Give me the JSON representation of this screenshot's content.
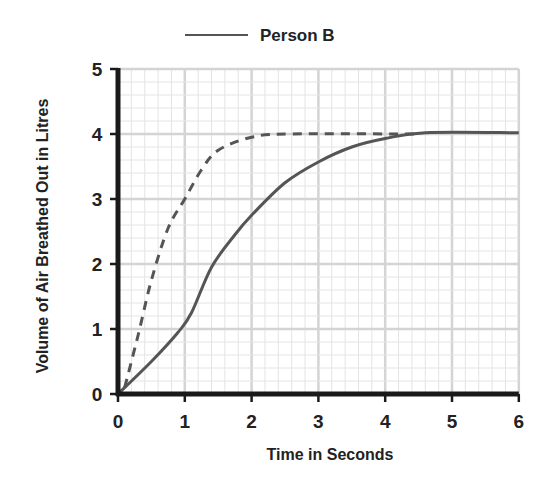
{
  "chart_data": {
    "type": "line",
    "title": "",
    "xlabel": "Time in Seconds",
    "ylabel": "Volume of Air Breathed Out in Litres",
    "xlim": [
      0,
      6
    ],
    "ylim": [
      0,
      5
    ],
    "xticks": [
      "0",
      "1",
      "2",
      "3",
      "4",
      "5",
      "6"
    ],
    "yticks": [
      "0",
      "1",
      "2",
      "3",
      "4",
      "5"
    ],
    "grid": {
      "major_step": 1,
      "minor_step": 0.2,
      "on": true
    },
    "legend": {
      "position": "top-center",
      "entries": [
        {
          "label": "Person B",
          "style": "solid"
        }
      ]
    },
    "series": [
      {
        "name": "Dashed line (unlabeled)",
        "style": "dashed",
        "color": "#555555",
        "points": [
          [
            0.1,
            0.1
          ],
          [
            0.3,
            0.9
          ],
          [
            0.5,
            1.75
          ],
          [
            0.75,
            2.55
          ],
          [
            1.0,
            3.0
          ],
          [
            1.25,
            3.45
          ],
          [
            1.5,
            3.75
          ],
          [
            2.0,
            3.95
          ],
          [
            2.6,
            4.0
          ],
          [
            4.5,
            4.0
          ]
        ]
      },
      {
        "name": "Person B",
        "style": "solid",
        "color": "#555555",
        "points": [
          [
            0,
            0
          ],
          [
            0.5,
            0.5
          ],
          [
            0.9,
            0.95
          ],
          [
            1.1,
            1.25
          ],
          [
            1.4,
            1.95
          ],
          [
            1.75,
            2.45
          ],
          [
            2.0,
            2.75
          ],
          [
            2.5,
            3.25
          ],
          [
            3.0,
            3.57
          ],
          [
            3.5,
            3.8
          ],
          [
            4.0,
            3.93
          ],
          [
            4.6,
            4.02
          ],
          [
            6.0,
            4.02
          ]
        ]
      }
    ]
  },
  "colors": {
    "axis": "#1a1a1a",
    "grid_major": "#d4d4d4",
    "grid_minor": "#e4e4e4",
    "line": "#555555",
    "text": "#222222"
  }
}
